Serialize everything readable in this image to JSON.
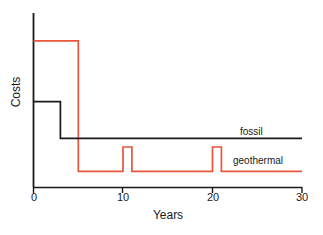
{
  "chart_data": {
    "type": "line",
    "title": "",
    "subtitle": "",
    "xlabel": "Years",
    "ylabel": "Costs",
    "xlim": [
      0,
      30
    ],
    "ylim": [
      0,
      1
    ],
    "grid": false,
    "legend_position": "inline-right",
    "xticks": [
      0,
      10,
      20,
      30
    ],
    "xtick_labels": [
      "0",
      "10",
      "20",
      "30"
    ],
    "yticks": [],
    "ytick_labels": [],
    "annotations": [
      {
        "text": "fossil",
        "x": 23,
        "y": 0.345,
        "color": "#1a1a1a"
      },
      {
        "text": "geothermal",
        "x": 22.5,
        "y": 0.19,
        "color": "#1a1a1a"
      }
    ],
    "series": [
      {
        "name": "fossil",
        "color": "#1a1a1a",
        "style": "step",
        "note": "High initial operating cost for 3 years then drops to a constant moderate level",
        "points": [
          {
            "x": 0,
            "y": 0.49
          },
          {
            "x": 3,
            "y": 0.49
          },
          {
            "x": 3,
            "y": 0.28
          },
          {
            "x": 30,
            "y": 0.28
          }
        ]
      },
      {
        "name": "geothermal",
        "color": "#e8563c",
        "style": "step",
        "note": "Very high capital cost for first 5 years, then low running cost with maintenance spikes at years 10 and 20",
        "points": [
          {
            "x": 0,
            "y": 0.84
          },
          {
            "x": 5,
            "y": 0.84
          },
          {
            "x": 5,
            "y": 0.09
          },
          {
            "x": 10,
            "y": 0.09
          },
          {
            "x": 10,
            "y": 0.23
          },
          {
            "x": 11,
            "y": 0.23
          },
          {
            "x": 11,
            "y": 0.09
          },
          {
            "x": 20,
            "y": 0.09
          },
          {
            "x": 20,
            "y": 0.23
          },
          {
            "x": 21,
            "y": 0.23
          },
          {
            "x": 21,
            "y": 0.09
          },
          {
            "x": 30,
            "y": 0.09
          }
        ]
      }
    ]
  },
  "axes": {
    "x_title": "Years",
    "y_title": "Costs",
    "tick_0": "0",
    "tick_10": "10",
    "tick_20": "20",
    "tick_30": "30"
  },
  "labels": {
    "fossil": "fossil",
    "geothermal": "geothermal"
  },
  "colors": {
    "axis": "#1a1a1a",
    "fossil": "#1a1a1a",
    "geothermal": "#e8563c",
    "background": "#ffffff"
  }
}
